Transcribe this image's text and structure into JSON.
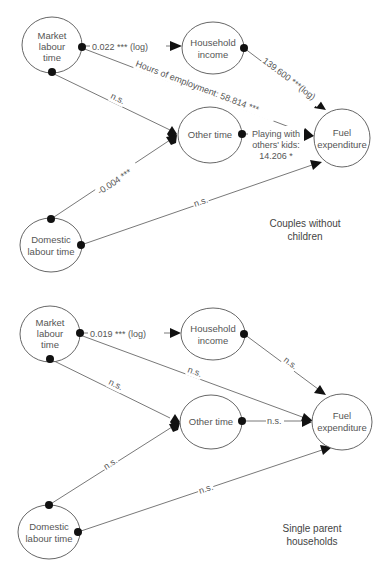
{
  "panels": [
    {
      "title_line1": "Couples without",
      "title_line2": "children",
      "nodes": {
        "market": {
          "line1": "Market",
          "line2": "labour",
          "line3": "time"
        },
        "income": {
          "line1": "Household",
          "line2": "income"
        },
        "other": {
          "line1": "Other time"
        },
        "fuel": {
          "line1": "Fuel",
          "line2": "expenditure"
        },
        "domestic": {
          "line1": "Domestic",
          "line2": "labour time"
        }
      },
      "edges": {
        "market_income": "0.022 *** (log)",
        "market_fuel": "Hours of employment: 58.814 ***",
        "income_fuel": "139.600 ***(log)",
        "market_other": "n.s.",
        "other_fuel_line1": "Playing with",
        "other_fuel_line2": "others' kids:",
        "other_fuel_line3": "14.206 *",
        "domestic_other": "-0.004 ***",
        "domestic_fuel": "n.s."
      }
    },
    {
      "title_line1": "Single parent",
      "title_line2": "households",
      "nodes": {
        "market": {
          "line1": "Market",
          "line2": "labour",
          "line3": "time"
        },
        "income": {
          "line1": "Household",
          "line2": "income"
        },
        "other": {
          "line1": "Other time"
        },
        "fuel": {
          "line1": "Fuel",
          "line2": "expenditure"
        },
        "domestic": {
          "line1": "Domestic",
          "line2": "labour time"
        }
      },
      "edges": {
        "market_income": "0.019 *** (log)",
        "market_fuel": "n.s.",
        "income_fuel": "n.s.",
        "market_other": "n.s.",
        "other_fuel": "n.s.",
        "domestic_other": "n.s.",
        "domestic_fuel": "n.s."
      }
    }
  ]
}
